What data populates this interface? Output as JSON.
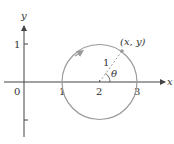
{
  "diagram": {
    "axes": {
      "x_label": "x",
      "y_label": "y",
      "origin_label": "0",
      "x_ticks": [
        "1",
        "2",
        "3"
      ],
      "y_ticks": [
        "1"
      ]
    },
    "circle": {
      "center": [
        2,
        0
      ],
      "radius": 1,
      "direction": "counterclockwise",
      "color": "#9a9a9a"
    },
    "point_label": "(x, y)",
    "radius_label": "1",
    "angle_label": "θ",
    "axis_color": "#444444"
  }
}
